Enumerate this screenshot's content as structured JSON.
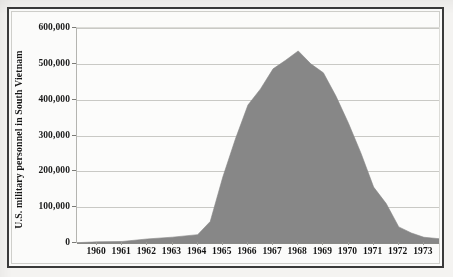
{
  "figure": {
    "background_color": "#f4f3f1",
    "frame_color": "#3a3a3a",
    "plot_background_color": "#fcfcfb"
  },
  "chart_data": {
    "type": "area",
    "title": "",
    "subtitle": "",
    "xlabel": "",
    "ylabel": "U.S. military personnel in South Vietnam",
    "series_color": "#878787",
    "grid": true,
    "grid_axis": "y",
    "legend": false,
    "legend_position": "none",
    "xlim": [
      1959.2,
      1973.6
    ],
    "ylim": [
      0,
      600000
    ],
    "y_ticks": [
      0,
      100000,
      200000,
      300000,
      400000,
      500000,
      600000
    ],
    "y_tick_labels": [
      "0",
      "100,000",
      "200,000",
      "300,000",
      "400,000",
      "500,000",
      "600,000"
    ],
    "x_ticks": [
      1960,
      1961,
      1962,
      1963,
      1964,
      1965,
      1966,
      1967,
      1968,
      1969,
      1970,
      1971,
      1972,
      1973
    ],
    "x_tick_labels": [
      "1960",
      "1961",
      "1962",
      "1963",
      "1964",
      "1965",
      "1966",
      "1967",
      "1968",
      "1969",
      "1970",
      "1971",
      "1972",
      "1973"
    ],
    "categories": [
      1959.2,
      1960,
      1961,
      1962,
      1963,
      1964,
      1964.5,
      1965,
      1965.5,
      1966,
      1966.5,
      1967,
      1967.5,
      1968,
      1968.5,
      1969,
      1969.5,
      1970,
      1970.5,
      1971,
      1971.5,
      1972,
      1972.5,
      1973,
      1973.6
    ],
    "values": [
      900,
      3200,
      4300,
      11300,
      16300,
      23300,
      60000,
      184000,
      290000,
      385000,
      430000,
      486000,
      510000,
      536000,
      500000,
      475000,
      410000,
      334000,
      250000,
      156000,
      110000,
      45000,
      28000,
      16000,
      12000
    ],
    "annotations": [
      {
        "label": "peak",
        "x": 1968,
        "y": 536000
      }
    ],
    "units": "personnel"
  }
}
